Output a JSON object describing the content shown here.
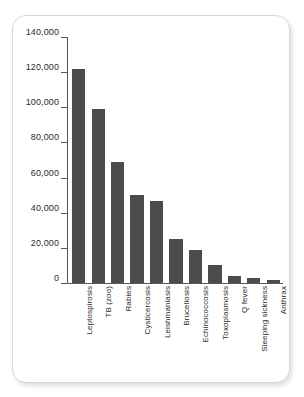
{
  "chart_data": {
    "type": "bar",
    "title": "",
    "subtitle": "",
    "xlabel": "",
    "ylabel": "",
    "categories": [
      "Leptospirosis",
      "TB (zoo)",
      "Rabies",
      "Cysticercosis",
      "Leishmaniasis",
      "Brucellosis",
      "Echinococcosis",
      "Toxoplasmosis",
      "Q fever",
      "Sleeping sickness",
      "Anthrax"
    ],
    "values": [
      122000,
      99000,
      69000,
      50000,
      46500,
      25000,
      18500,
      10500,
      3800,
      2800,
      1600
    ],
    "ylim": [
      0,
      140000
    ],
    "ytick_values": [
      0,
      20000,
      40000,
      60000,
      80000,
      100000,
      120000,
      140000
    ],
    "ytick_labels": [
      "0",
      "20,000",
      "40,000",
      "60,000",
      "80,000",
      "100,000",
      "120,000",
      "140,000"
    ],
    "grid": false,
    "legend": null,
    "legend_position": "none",
    "bar_color": "#4c4c4c",
    "axis_color": "#585858",
    "text_color": "#2b2b2b",
    "background_color": "#ffffff",
    "card_border_color": "#d8d8d8"
  }
}
